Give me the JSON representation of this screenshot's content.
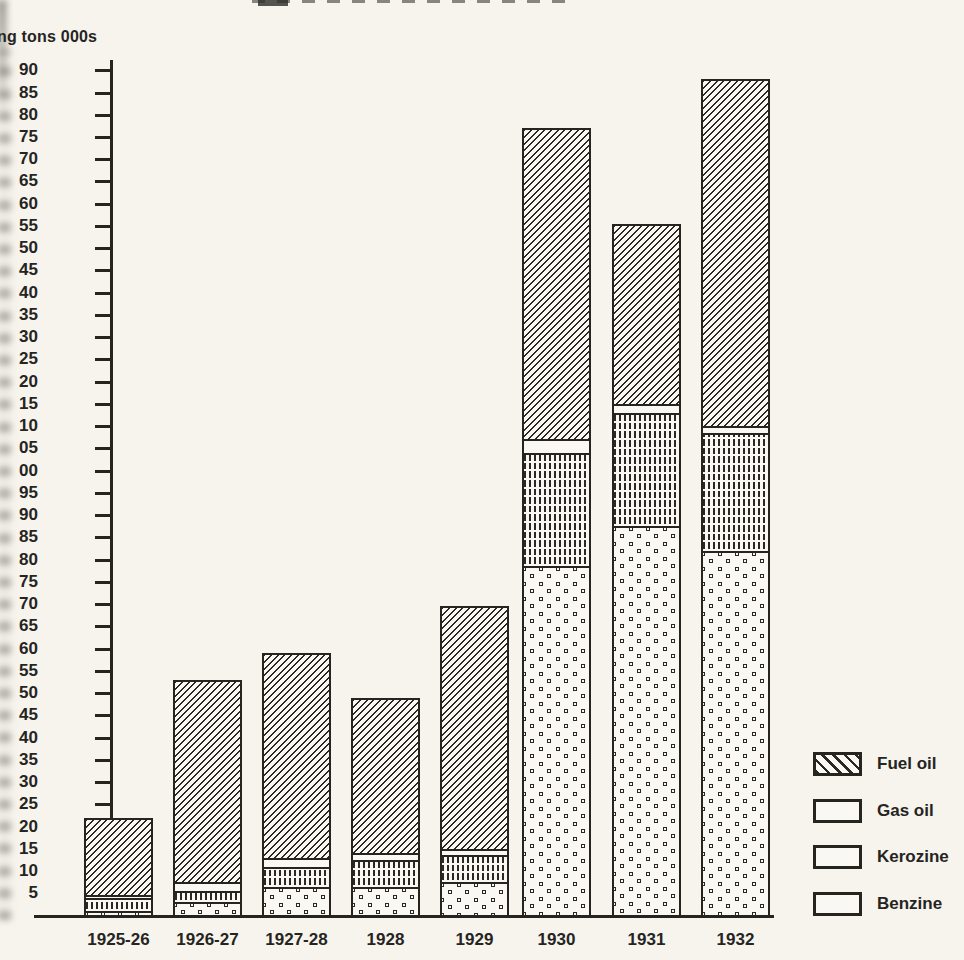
{
  "axis": {
    "y_title": "ng tons 000s"
  },
  "chart_data": {
    "type": "bar",
    "stacked": true,
    "ylabel": "ng tons 000s",
    "categories": [
      "1925-26",
      "1926-27",
      "1927-28",
      "1928",
      "1929",
      "1930",
      "1931",
      "1932"
    ],
    "series": [
      {
        "name": "Benzine",
        "values": [
          1.0,
          3.0,
          6.5,
          6.5,
          7.5,
          78.5,
          87.5,
          82.0
        ]
      },
      {
        "name": "Kerozine",
        "values": [
          3.0,
          2.5,
          4.5,
          6.0,
          6.0,
          25.5,
          25.5,
          26.5
        ]
      },
      {
        "name": "Gas oil",
        "values": [
          0.5,
          2.0,
          2.0,
          1.5,
          1.5,
          3.0,
          2.0,
          1.5
        ]
      },
      {
        "name": "Fuel oil",
        "values": [
          17.5,
          45.5,
          46.0,
          35.0,
          54.5,
          70.0,
          40.5,
          78.0
        ]
      }
    ],
    "stack_totals": [
      22,
      53,
      59,
      49,
      69.5,
      177,
      155.5,
      188
    ],
    "ylim": [
      0,
      190
    ],
    "ytick_step": 5,
    "ytick_values": [
      190,
      185,
      180,
      175,
      170,
      165,
      160,
      155,
      150,
      145,
      140,
      135,
      130,
      125,
      120,
      115,
      110,
      105,
      100,
      95,
      90,
      85,
      80,
      75,
      70,
      65,
      60,
      55,
      50,
      45,
      40,
      35,
      30,
      25,
      20,
      15,
      10,
      5
    ],
    "ytick_labels_visible": [
      "90",
      "85",
      "80",
      "75",
      "70",
      "65",
      "60",
      "55",
      "50",
      "45",
      "40",
      "35",
      "30",
      "25",
      "20",
      "15",
      "10",
      "05",
      "00",
      "95",
      "90",
      "85",
      "80",
      "75",
      "70",
      "65",
      "60",
      "55",
      "50",
      "45",
      "40",
      "35",
      "30",
      "25",
      "20",
      "15",
      "10",
      "5"
    ],
    "grid": false,
    "legend_position": "bottom-right",
    "legend": [
      {
        "label": "Fuel oil",
        "pattern": "diagonal-hatch"
      },
      {
        "label": "Gas oil",
        "pattern": "plain-white"
      },
      {
        "label": "Kerozine",
        "pattern": "vertical-dashes"
      },
      {
        "label": "Benzine",
        "pattern": "open-dots"
      }
    ]
  },
  "colors": {
    "ink": "#26241f",
    "paper": "#f6f4ed",
    "bar_fill": "#faf8f2"
  }
}
